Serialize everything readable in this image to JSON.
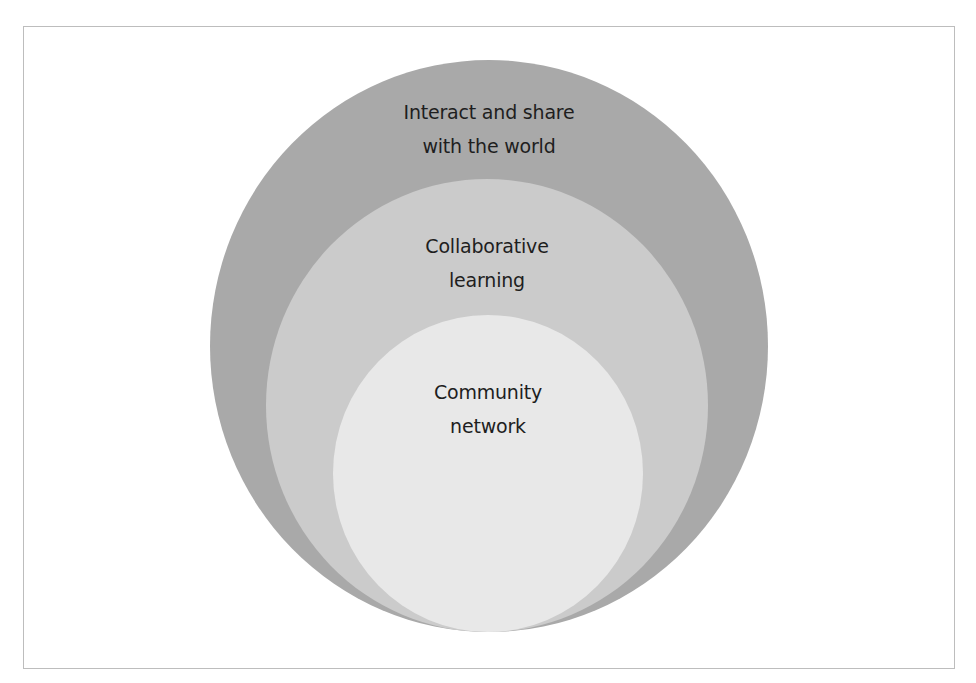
{
  "diagram": {
    "type": "nested-circles",
    "colors": {
      "outer": "#a9a9a9",
      "middle": "#cbcbcb",
      "inner": "#e8e8e8",
      "frame_border": "#bdbdbd",
      "text": "#1e1e1e"
    },
    "layers": [
      {
        "level": "outer",
        "lines": [
          "Interact and share",
          "with the world"
        ]
      },
      {
        "level": "middle",
        "lines": [
          "Collaborative",
          "learning"
        ]
      },
      {
        "level": "inner",
        "lines": [
          "Community",
          "network"
        ]
      }
    ]
  }
}
